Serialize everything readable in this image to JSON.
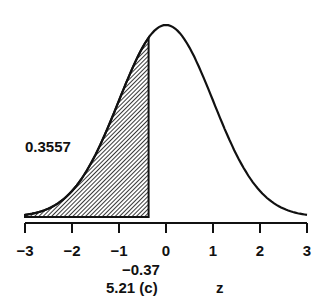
{
  "chart_data": {
    "type": "area",
    "title": "",
    "xlabel": "z",
    "ylabel": "",
    "xlim": [
      -3,
      3
    ],
    "x_ticks": [
      "−3",
      "−2",
      "−1",
      "0",
      "1",
      "2",
      "3"
    ],
    "shaded_region": {
      "from": -3,
      "to": -0.37,
      "area": 0.3557,
      "pattern": "diagonal-hatch"
    },
    "cutoff_label": "−0.37",
    "area_label": "0.3557",
    "grid": false
  },
  "labels": {
    "area": "0.3557",
    "cutoff": "−0.37",
    "caption": "5.21 (c)",
    "axis": "z"
  },
  "ticks": [
    "−3",
    "−2",
    "−1",
    "0",
    "1",
    "2",
    "3"
  ]
}
